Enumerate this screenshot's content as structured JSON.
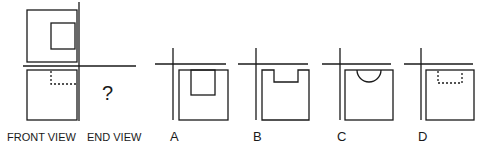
{
  "question": {
    "labels": {
      "front": "FRONT VIEW",
      "end": "END VIEW"
    },
    "unknown_mark": "?"
  },
  "options": [
    {
      "letter": "A",
      "description": "square with solid inner rectangle cut from top"
    },
    {
      "letter": "B",
      "description": "square outline with notch at top"
    },
    {
      "letter": "C",
      "description": "square with semicircle at top"
    },
    {
      "letter": "D",
      "description": "square with dashed hidden rectangle at top"
    }
  ],
  "colors": {
    "line": "#1a1a1a",
    "background": "#ffffff"
  }
}
